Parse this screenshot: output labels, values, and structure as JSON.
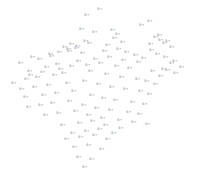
{
  "chart_data": {
    "type": "scatter",
    "title": "",
    "subtitle": "",
    "xlabel": "",
    "ylabel": "",
    "xlim": [
      0,
      197
    ],
    "ylim": [
      0,
      176
    ],
    "grid": false,
    "axes_visible": false,
    "legend": null,
    "background_color": "#ffffff",
    "marker_style": "text-label",
    "marker_color": "#8a8a92",
    "marker_text": "B+",
    "point_count": 131,
    "series": [
      {
        "name": "points",
        "color": "#8a8a92",
        "labels": [
          "B+",
          "B+",
          "B+",
          "B+",
          "B+",
          "B+",
          "B+",
          "B+",
          "B+",
          "B+",
          "B+",
          "B+",
          "B+",
          "B+",
          "B+",
          "B+",
          "B+",
          "B+",
          "B+",
          "B+",
          "B+",
          "B+",
          "B+",
          "B+",
          "B+",
          "B+",
          "B+",
          "B+",
          "B+",
          "B+",
          "B+",
          "B+",
          "B+",
          "B+",
          "B+",
          "B+",
          "B+",
          "B+",
          "B+",
          "B+",
          "B+",
          "B+",
          "B+",
          "B+",
          "B+",
          "B+",
          "B+",
          "B+",
          "B+",
          "B+",
          "B+",
          "B+",
          "B+",
          "B+",
          "B+",
          "B+",
          "B+",
          "B+",
          "B+",
          "B+",
          "B+",
          "B+",
          "B+",
          "B+",
          "B+",
          "B+",
          "B+",
          "B+",
          "B+",
          "B+",
          "B+",
          "B+",
          "B+",
          "B+",
          "B+",
          "B+",
          "B+",
          "B+",
          "B+",
          "B+",
          "B+",
          "B+",
          "B+",
          "B+",
          "B+",
          "B+",
          "B+",
          "B+",
          "B+",
          "B+",
          "B+",
          "B+",
          "B+",
          "B+",
          "B+",
          "B+",
          "B+",
          "B+",
          "B+",
          "B+",
          "B+",
          "B+",
          "B+",
          "B+",
          "B+",
          "B+",
          "B+",
          "B+",
          "B+",
          "B+",
          "B+",
          "B+",
          "B+",
          "B+",
          "B+",
          "B+",
          "B+",
          "B+",
          "B+",
          "B+",
          "B+",
          "B+",
          "B+",
          "B+",
          "B+",
          "B+",
          "B+",
          "B+",
          "B+",
          "B+",
          "B+"
        ],
        "x": [
          100,
          87,
          150,
          142,
          82,
          95,
          113,
          118,
          156,
          161,
          151,
          168,
          65,
          72,
          70,
          77,
          86,
          115,
          160,
          165,
          172,
          51,
          33,
          60,
          69,
          78,
          90,
          108,
          123,
          152,
          158,
          166,
          175,
          21,
          40,
          52,
          83,
          105,
          119,
          127,
          136,
          144,
          172,
          182,
          164,
          30,
          47,
          58,
          79,
          96,
          110,
          124,
          139,
          168,
          176,
          31,
          43,
          61,
          72,
          88,
          101,
          117,
          130,
          153,
          161,
          14,
          27,
          38,
          55,
          64,
          91,
          107,
          122,
          138,
          147,
          156,
          22,
          35,
          49,
          68,
          85,
          99,
          112,
          126,
          141,
          150,
          26,
          44,
          57,
          74,
          92,
          104,
          116,
          133,
          145,
          29,
          41,
          53,
          70,
          84,
          97,
          111,
          129,
          140,
          46,
          59,
          76,
          89,
          103,
          120,
          134,
          148,
          63,
          80,
          93,
          106,
          121,
          73,
          87,
          100,
          114,
          67,
          81,
          95,
          108,
          75,
          89,
          102,
          79,
          92,
          85
        ],
        "y": [
          10,
          16,
          22,
          26,
          30,
          33,
          31,
          35,
          38,
          41,
          45,
          42,
          48,
          45,
          52,
          49,
          42,
          39,
          36,
          44,
          48,
          55,
          58,
          53,
          50,
          47,
          44,
          46,
          43,
          51,
          55,
          58,
          62,
          64,
          60,
          57,
          54,
          52,
          50,
          53,
          56,
          59,
          64,
          68,
          70,
          72,
          68,
          65,
          62,
          60,
          58,
          61,
          63,
          71,
          74,
          76,
          73,
          70,
          67,
          66,
          64,
          67,
          69,
          72,
          77,
          84,
          80,
          78,
          76,
          74,
          72,
          75,
          78,
          80,
          82,
          85,
          90,
          88,
          86,
          84,
          82,
          85,
          88,
          90,
          92,
          95,
          98,
          96,
          94,
          92,
          96,
          99,
          101,
          103,
          105,
          108,
          106,
          104,
          102,
          106,
          109,
          111,
          113,
          115,
          116,
          114,
          112,
          116,
          119,
          121,
          123,
          125,
          126,
          124,
          122,
          126,
          129,
          134,
          132,
          130,
          134,
          140,
          138,
          136,
          140,
          148,
          146,
          150,
          158,
          160,
          168
        ]
      }
    ]
  }
}
